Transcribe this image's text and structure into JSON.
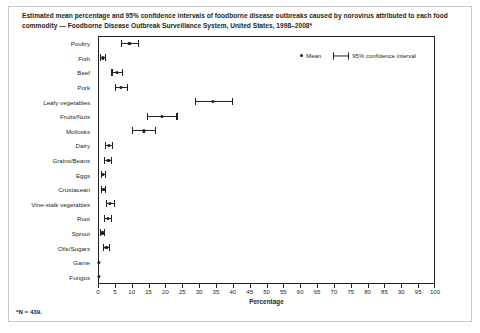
{
  "figure": {
    "title": "Estimated mean percentage and 95% confidence intervals of foodborne disease outbreaks caused by norovirus attributed to each food commodity — Foodborne Disease Outbreak Surveillance System, United States, 1998–2008*",
    "footnote": "*N = 439."
  },
  "legend": {
    "mean_label": "Mean",
    "ci_label": "95% confidence interval"
  },
  "chart_data": {
    "type": "scatter",
    "orientation": "horizontal",
    "title": "Estimated mean percentage and 95% confidence intervals of foodborne disease outbreaks caused by norovirus attributed to each food commodity — Foodborne Disease Outbreak Surveillance System, United States, 1998–2008*",
    "xlabel": "Percentage",
    "ylabel": "",
    "xlim": [
      0,
      100
    ],
    "xticks": [
      0,
      5,
      10,
      15,
      20,
      25,
      30,
      35,
      40,
      45,
      50,
      55,
      60,
      65,
      70,
      75,
      80,
      85,
      90,
      95,
      100
    ],
    "grid": false,
    "legend_position": "top-right",
    "categories": [
      "Poultry",
      "Fish",
      "Beef",
      "Pork",
      "Leafy vegetables",
      "Fruits/Nuts",
      "Mollusks",
      "Dairy",
      "Grains/Beans",
      "Eggs",
      "Crustacean",
      "Vine-stalk vegetables",
      "Root",
      "Sprout",
      "Oils/Sugars",
      "Game",
      "Fungus"
    ],
    "series": [
      {
        "name": "Mean",
        "values": [
          9.3,
          1.4,
          5.7,
          6.8,
          34.0,
          19.0,
          13.7,
          3.2,
          3.1,
          1.5,
          1.6,
          3.6,
          2.9,
          1.3,
          2.5,
          0.3,
          0.3
        ]
      },
      {
        "name": "95% CI lower",
        "values": [
          6.9,
          0.5,
          4.0,
          5.0,
          28.7,
          14.6,
          10.1,
          2.0,
          1.9,
          0.8,
          0.8,
          2.3,
          1.8,
          0.7,
          1.5,
          0.3,
          0.3
        ]
      },
      {
        "name": "95% CI upper",
        "values": [
          12.2,
          2.3,
          7.5,
          8.8,
          40.0,
          23.6,
          17.3,
          4.4,
          4.3,
          2.3,
          2.4,
          5.0,
          4.1,
          2.0,
          3.6,
          0.3,
          0.3
        ]
      }
    ]
  }
}
